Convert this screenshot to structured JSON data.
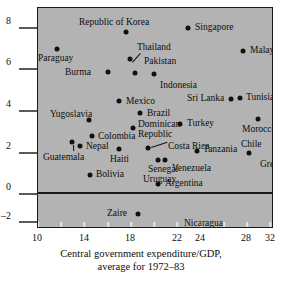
{
  "chart_data": {
    "type": "scatter",
    "title": "",
    "xlabel": "Central government expenditure/GDP, average for 1972–83",
    "xlabel_line1": "Central government expenditure/GDP,",
    "xlabel_line2": "average for 1972–83",
    "ylabel": "",
    "xlim": [
      10,
      33.5
    ],
    "ylim": [
      -2.9,
      9.1
    ],
    "xticks": [
      10,
      14,
      18,
      22,
      24,
      28,
      32
    ],
    "xticklabels": [
      "10",
      "14",
      "18",
      "22",
      "24",
      "28",
      "32"
    ],
    "xminor_ticks": [
      12,
      16,
      20,
      26,
      30
    ],
    "yticks": [
      8,
      6,
      4,
      2,
      0,
      -2
    ],
    "yticklabels": [
      "8",
      "6",
      "4",
      "2",
      "0",
      "–2"
    ],
    "grid": false,
    "legend": false,
    "zero_reference_line": 0,
    "points": [
      {
        "label": "Republic of Korea",
        "x": 17.6,
        "y": 7.8,
        "label_pos": "above"
      },
      {
        "label": "Singapore",
        "x": 22.9,
        "y": 8.0,
        "label_pos": "right"
      },
      {
        "label": "Paraguay",
        "x": 11.6,
        "y": 7.0,
        "label_pos": "below"
      },
      {
        "label": "Thailand",
        "x": 17.9,
        "y": 6.5,
        "label_pos": "right-leader"
      },
      {
        "label": "Pakistan",
        "x": 17.9,
        "y": 6.5,
        "label_pos": "right"
      },
      {
        "label": "Malaysia",
        "x": 27.6,
        "y": 6.9,
        "label_pos": "right"
      },
      {
        "label": "Burma",
        "x": 16.0,
        "y": 5.9,
        "label_pos": "left"
      },
      {
        "label": "Indonesia",
        "x": 19.9,
        "y": 5.8,
        "label_pos": "below-right"
      },
      {
        "label": "Mexico",
        "x": 17.0,
        "y": 4.5,
        "label_pos": "right"
      },
      {
        "label": "Sri Lanka",
        "x": 26.6,
        "y": 4.6,
        "label_pos": "left"
      },
      {
        "label": "Tunisia",
        "x": 27.4,
        "y": 4.7,
        "label_pos": "right"
      },
      {
        "label": "Yugoslavia",
        "x": 14.4,
        "y": 3.6,
        "label_pos": "above"
      },
      {
        "label": "Brazil",
        "x": 18.8,
        "y": 3.9,
        "label_pos": "right"
      },
      {
        "label": "Morocco",
        "x": 28.9,
        "y": 3.7,
        "label_pos": "below"
      },
      {
        "label": "Turkey",
        "x": 22.2,
        "y": 3.4,
        "label_pos": "right"
      },
      {
        "label": "Colombia",
        "x": 14.6,
        "y": 2.9,
        "label_pos": "right"
      },
      {
        "label": "Dominican Republic",
        "x": 18.2,
        "y": 3.2,
        "label_pos": "above-right"
      },
      {
        "label": "Nepal",
        "x": 13.6,
        "y": 2.4,
        "label_pos": "right"
      },
      {
        "label": "Guatemala",
        "x": 12.9,
        "y": 2.6,
        "label_pos": "below-leader"
      },
      {
        "label": "Costa Rica",
        "x": 19.4,
        "y": 2.3,
        "label_pos": "right-leader"
      },
      {
        "label": "Tanzania",
        "x": 23.7,
        "y": 2.2,
        "label_pos": "right"
      },
      {
        "label": "Chile",
        "x": 28.1,
        "y": 2.1,
        "label_pos": "above"
      },
      {
        "label": "Greece",
        "x": 31.0,
        "y": 2.2,
        "label_pos": "below-leader"
      },
      {
        "label": "Haiti",
        "x": 17.0,
        "y": 2.2,
        "label_pos": "below"
      },
      {
        "label": "Senegal",
        "x": 20.3,
        "y": 2.1,
        "label_pos": "below"
      },
      {
        "label": "Uruguay",
        "x": 21.6,
        "y": 1.6,
        "label_pos": "below-left"
      },
      {
        "label": "Venezuela",
        "x": 22.2,
        "y": 1.6,
        "label_pos": "right"
      },
      {
        "label": "Bolivia",
        "x": 14.5,
        "y": 0.9,
        "label_pos": "right"
      },
      {
        "label": "Argentina",
        "x": 20.4,
        "y": 0.5,
        "label_pos": "right"
      },
      {
        "label": "Zaire",
        "x": 18.6,
        "y": -1.1,
        "label_pos": "left"
      },
      {
        "label": "Nicaragua",
        "x": 24.3,
        "y": -1.9,
        "label_pos": "above"
      }
    ]
  },
  "axis": {
    "x_label_line1": "Central government expenditure/GDP,",
    "x_label_line2": "average for 1972–83"
  },
  "colors": {
    "panel_background": "#b3b3b3",
    "point": "#111111",
    "axis_line": "#1a1a1a",
    "tick_line": "#5a5a5a",
    "text": "#0d0d0d",
    "page_background": "#ffffff"
  }
}
